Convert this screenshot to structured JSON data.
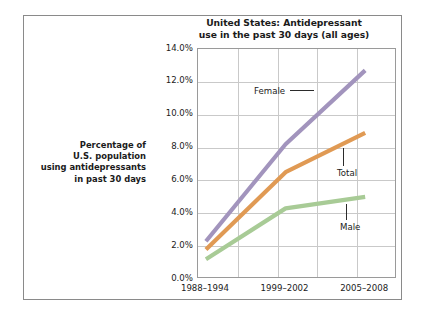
{
  "chart_data": {
    "type": "line",
    "title": "United States: Antidepressant use in the past 30 days (all ages)",
    "title_line1": "United States: Antidepressant",
    "title_line2": "use in the past 30 days (all ages)",
    "xlabel": "",
    "ylabel": "Percentage of U.S. population using antidepressants in past 30 days",
    "ylabel_line1": "Percentage of",
    "ylabel_line2": "U.S. population",
    "ylabel_line3": "using antidepressants",
    "ylabel_line4": "in past 30 days",
    "categories": [
      "1988–1994",
      "1999–2002",
      "2005–2008"
    ],
    "x_tick_labels": [
      "1988–1994",
      "1999–2002",
      "2005–2008"
    ],
    "y_tick_labels": [
      "0.0%",
      "2.0%",
      "4.0%",
      "6.0%",
      "8.0%",
      "10.0%",
      "12.0%",
      "14.0%"
    ],
    "y_tick_values": [
      0,
      2,
      4,
      6,
      8,
      10,
      12,
      14
    ],
    "ylim": [
      0,
      14
    ],
    "y_unit": "%",
    "grid": true,
    "legend_position": "inline-annotations",
    "series": [
      {
        "name": "Female",
        "color": "#a294bd",
        "values": [
          2.3,
          8.2,
          12.7
        ]
      },
      {
        "name": "Total",
        "color": "#e09a54",
        "values": [
          1.8,
          6.5,
          8.9
        ]
      },
      {
        "name": "Male",
        "color": "#a8cb96",
        "values": [
          1.2,
          4.3,
          5.0
        ]
      }
    ],
    "annotations": [
      {
        "text": "Female",
        "series": "Female",
        "leader": "horizontal"
      },
      {
        "text": "Total",
        "series": "Total",
        "leader": "vertical"
      },
      {
        "text": "Male",
        "series": "Male",
        "leader": "vertical"
      }
    ]
  },
  "colors": {
    "female": "#a294bd",
    "total": "#e09a54",
    "male": "#a8cb96",
    "grid": "#c9c9c9",
    "axis": "#9a9a9a",
    "frame": "#8a8a8a",
    "text": "#1b1b1b",
    "background": "#ffffff"
  }
}
